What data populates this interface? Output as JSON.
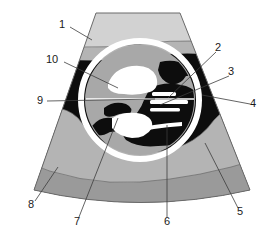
{
  "figure": {
    "background_color": "#ffffff",
    "width": 280,
    "height": 245
  },
  "palette": {
    "white": "#ffffff",
    "light_gray": "#d2d2d2",
    "mid_gray": "#b4b4b4",
    "dark_gray": "#9a9a9a",
    "inner_gray": "#a8a8a8",
    "black": "#0d0d0d",
    "outline": "#5a5a5a",
    "leader": "#3c3c3c",
    "text": "#1a1a1a"
  },
  "regions": [
    {
      "name": "transducer-near-field-band",
      "fill": "#d2d2d2"
    },
    {
      "name": "subcutaneous-band",
      "fill": "#b4b4b4"
    },
    {
      "name": "anechoic-black-field",
      "fill": "#0d0d0d"
    },
    {
      "name": "circular-structure-interior",
      "fill": "#a8a8a8"
    },
    {
      "name": "circular-structure-ring",
      "fill": "#ffffff"
    },
    {
      "name": "deep-tissue-band-upper",
      "fill": "#b4b4b4"
    },
    {
      "name": "deep-tissue-band-lower",
      "fill": "#9a9a9a"
    }
  ],
  "labels": [
    {
      "id": "1",
      "text": "1",
      "x": 62,
      "y": 25,
      "leader": [
        [
          70,
          27
        ],
        [
          92,
          40
        ]
      ]
    },
    {
      "id": "2",
      "text": "2",
      "x": 218,
      "y": 48,
      "leader": [
        [
          216,
          52
        ],
        [
          168,
          98
        ]
      ]
    },
    {
      "id": "3",
      "text": "3",
      "x": 231,
      "y": 72,
      "leader": [
        [
          229,
          76
        ],
        [
          160,
          105
        ]
      ]
    },
    {
      "id": "4",
      "text": "4",
      "x": 253,
      "y": 104,
      "leader": [
        [
          250,
          104
        ],
        [
          202,
          95
        ]
      ]
    },
    {
      "id": "5",
      "text": "5",
      "x": 240,
      "y": 212,
      "leader": [
        [
          238,
          208
        ],
        [
          205,
          143
        ]
      ]
    },
    {
      "id": "6",
      "text": "6",
      "x": 167,
      "y": 222,
      "leader": [
        [
          167,
          217
        ],
        [
          167,
          125
        ]
      ]
    },
    {
      "id": "7",
      "text": "7",
      "x": 77,
      "y": 222,
      "leader": [
        [
          79,
          217
        ],
        [
          118,
          118
        ]
      ]
    },
    {
      "id": "8",
      "text": "8",
      "x": 31,
      "y": 205,
      "leader": [
        [
          35,
          201
        ],
        [
          58,
          167
        ]
      ]
    },
    {
      "id": "9",
      "text": "9",
      "x": 40,
      "y": 101,
      "leader": [
        [
          47,
          101
        ],
        [
          155,
          99
        ]
      ]
    },
    {
      "id": "10",
      "text": "10",
      "x": 52,
      "y": 60,
      "leader": [
        [
          64,
          62
        ],
        [
          118,
          88
        ]
      ]
    }
  ]
}
